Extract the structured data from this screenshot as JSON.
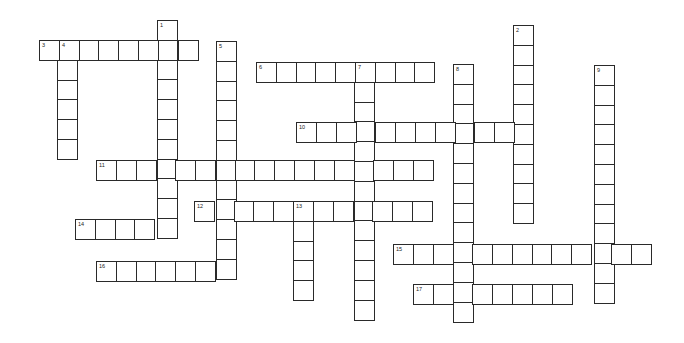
{
  "puzzle": {
    "type": "crossword",
    "cell_size": 19.8,
    "colors": {
      "border": "#2a2a2a",
      "cell": "#ffffff",
      "number": "#222222"
    },
    "words": [
      {
        "number": "1",
        "direction": "down",
        "x": 157,
        "y": 20,
        "length": 11
      },
      {
        "number": "2",
        "direction": "down",
        "x": 513,
        "y": 25,
        "length": 10
      },
      {
        "number": "3",
        "direction": "across",
        "x": 39,
        "y": 40,
        "length": 8
      },
      {
        "number": "4",
        "direction": "down",
        "x": 57,
        "y": 40,
        "length": 6
      },
      {
        "number": "5",
        "direction": "down",
        "x": 216,
        "y": 41,
        "length": 12
      },
      {
        "number": "6",
        "direction": "across",
        "x": 256,
        "y": 62,
        "length": 9
      },
      {
        "number": "7",
        "direction": "down",
        "x": 354,
        "y": 62,
        "length": 13
      },
      {
        "number": "8",
        "direction": "down",
        "x": 453,
        "y": 64,
        "length": 13
      },
      {
        "number": "9",
        "direction": "down",
        "x": 594,
        "y": 65,
        "length": 12
      },
      {
        "number": "10",
        "direction": "across",
        "x": 296,
        "y": 122,
        "length": 12
      },
      {
        "number": "11",
        "direction": "across",
        "x": 96,
        "y": 160,
        "length": 17
      },
      {
        "number": "12",
        "direction": "across",
        "x": 194,
        "y": 201,
        "length": 12
      },
      {
        "number": "13",
        "direction": "down",
        "x": 293,
        "y": 201,
        "length": 5
      },
      {
        "number": "14",
        "direction": "across",
        "x": 75,
        "y": 219,
        "length": 5
      },
      {
        "number": "15",
        "direction": "across",
        "x": 393,
        "y": 244,
        "length": 13
      },
      {
        "number": "16",
        "direction": "across",
        "x": 96,
        "y": 261,
        "length": 7
      },
      {
        "number": "17",
        "direction": "across",
        "x": 413,
        "y": 284,
        "length": 8
      }
    ]
  }
}
